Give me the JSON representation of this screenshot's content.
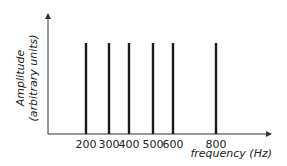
{
  "chart_data": {
    "type": "bar",
    "subtype": "line-spectrum",
    "title": "",
    "xlabel": "frequency (Hz)",
    "ylabel_line1": "Amplitude",
    "ylabel_line2": "(arbitrary units)",
    "categories": [
      "200",
      "300",
      "400",
      "500",
      "600",
      "800"
    ],
    "x": [
      200,
      300,
      400,
      500,
      600,
      800
    ],
    "values": [
      1,
      1,
      1,
      1,
      1,
      1
    ],
    "ylim": [
      0,
      1.3
    ],
    "grid": false,
    "legend": null,
    "tick_labels": [
      "200",
      "300",
      "400",
      "500",
      "600",
      "800"
    ],
    "colors": {
      "bar": "#1a1a1a",
      "axis": "#333333"
    }
  }
}
